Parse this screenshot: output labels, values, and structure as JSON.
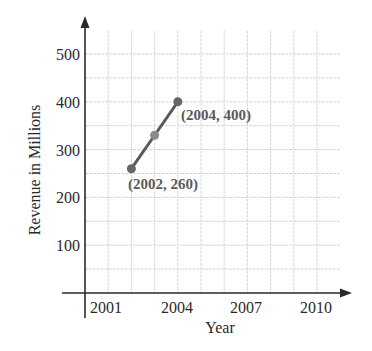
{
  "chart_data": {
    "type": "line",
    "title": "",
    "xlabel": "Year",
    "ylabel": "Revenue in Millions",
    "x_ticks": [
      2001,
      2004,
      2007,
      2010
    ],
    "y_ticks": [
      100,
      200,
      300,
      400,
      500
    ],
    "xlim": [
      2000,
      2011
    ],
    "ylim": [
      0,
      550
    ],
    "grid": true,
    "grid_x_step": 1,
    "grid_y_step": 50,
    "series": [
      {
        "name": "Revenue",
        "x": [
          2002,
          2003,
          2004
        ],
        "y": [
          260,
          330,
          400
        ],
        "color": "#5a5a5a"
      }
    ],
    "annotations": [
      {
        "text": "(2004, 400)",
        "x": 2004,
        "y": 400
      },
      {
        "text": "(2002, 260)",
        "x": 2002,
        "y": 260
      }
    ]
  },
  "labels": {
    "xlabel": "Year",
    "ylabel": "Revenue in Millions",
    "ann_top": "(2004, 400)",
    "ann_bottom": "(2002, 260)",
    "xt0": "2001",
    "xt1": "2004",
    "xt2": "2007",
    "xt3": "2010",
    "yt0": "100",
    "yt1": "200",
    "yt2": "300",
    "yt3": "400",
    "yt4": "500"
  },
  "colors": {
    "axis": "#2a2a2a",
    "grid": "#d6d6d6",
    "line": "#5a5a5a",
    "endpoint": "#666666",
    "midpoint": "#8a8a8a"
  }
}
